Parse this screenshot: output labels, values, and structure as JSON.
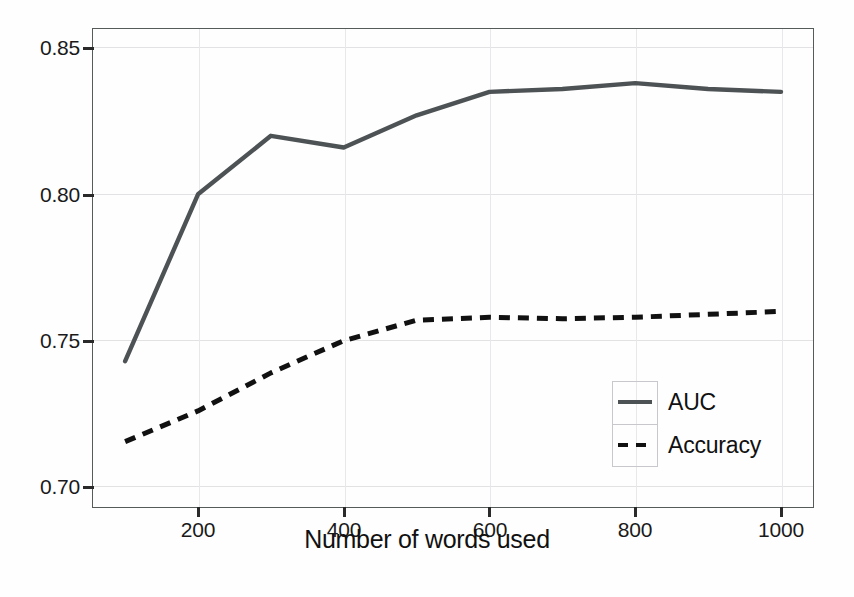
{
  "chart_data": {
    "type": "line",
    "title": "",
    "xlabel": "Number of words used",
    "ylabel": "",
    "xlim": [
      100,
      1000
    ],
    "ylim": [
      0.6905,
      0.8545
    ],
    "xticks": [
      200,
      400,
      600,
      800,
      1000
    ],
    "xtick_labels": [
      "200",
      "400",
      "600",
      "800",
      "1000"
    ],
    "yticks": [
      0.7,
      0.75,
      0.8,
      0.85
    ],
    "ytick_labels": [
      "0.70",
      "0.75",
      "0.80",
      "0.85"
    ],
    "grid": true,
    "legend_position": "lower-right",
    "x": [
      100,
      200,
      300,
      400,
      500,
      600,
      700,
      800,
      900,
      1000
    ],
    "series": [
      {
        "name": "AUC",
        "style": "solid",
        "color": "#4d5254",
        "values": [
          0.743,
          0.8,
          0.82,
          0.816,
          0.827,
          0.835,
          0.836,
          0.838,
          0.836,
          0.835
        ]
      },
      {
        "name": "Accuracy",
        "style": "dashed",
        "color": "#111111",
        "values": [
          0.7155,
          0.726,
          0.739,
          0.75,
          0.757,
          0.758,
          0.7575,
          0.758,
          0.759,
          0.76
        ]
      }
    ]
  },
  "axis": {
    "x_label": "Number of words used",
    "x_tick_labels": [
      "200",
      "400",
      "600",
      "800",
      "1000"
    ],
    "y_tick_labels": [
      "0.70",
      "0.75",
      "0.80",
      "0.85"
    ]
  },
  "legend": {
    "entries": [
      {
        "label": "AUC",
        "style": "solid"
      },
      {
        "label": "Accuracy",
        "style": "dashed"
      }
    ]
  },
  "colors": {
    "auc_line": "#4d5254",
    "accuracy_line": "#111111",
    "frame": "#555a5a",
    "grid": "#e2e2e4",
    "background": "#fefefe"
  }
}
